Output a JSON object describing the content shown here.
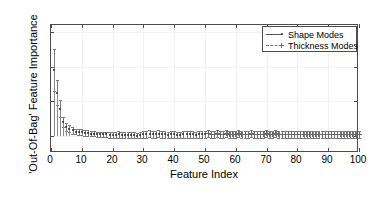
{
  "chart_data": {
    "type": "scatter",
    "title": "",
    "xlabel": "Feature Index",
    "ylabel": "'Out-Of-Bag' Feature Importance",
    "xlim": [
      0,
      100
    ],
    "ylim": [
      -0.25,
      1.6
    ],
    "xticks": [
      0,
      10,
      20,
      30,
      40,
      50,
      60,
      70,
      80,
      90,
      100
    ],
    "xticklabels": [
      "0",
      "10",
      "20",
      "30",
      "40",
      "50",
      "60",
      "70",
      "80",
      "90",
      "100"
    ],
    "yticks": [
      0,
      0.5,
      1,
      1.5
    ],
    "yticklabels": [
      "0",
      "0.5",
      "1",
      "1.5"
    ],
    "grid": true,
    "legend_position": "top-right",
    "marker_color": "#2b2b2b",
    "errorbar_color": "#7a7a7a",
    "series": [
      {
        "name": "Shape Modes",
        "marker": "dot",
        "linestyle": "solid",
        "x": [
          1,
          2,
          3,
          4,
          5,
          6,
          7,
          8,
          9,
          10,
          11,
          12,
          13,
          14,
          15,
          16,
          17,
          18,
          19,
          20,
          21,
          22,
          23,
          24,
          25,
          26,
          27,
          28,
          29,
          30,
          31,
          32,
          33,
          34,
          35,
          36,
          37,
          38,
          39,
          40,
          41,
          42,
          43,
          44,
          45,
          46,
          47,
          48,
          49,
          50
        ],
        "values": [
          0.95,
          0.62,
          0.39,
          0.2,
          0.13,
          0.1,
          0.08,
          0.06,
          0.05,
          0.05,
          0.04,
          0.04,
          0.03,
          0.03,
          0.02,
          0.02,
          0.02,
          0.02,
          0.01,
          0.01,
          0.01,
          0.02,
          0.01,
          0.01,
          0.01,
          0.01,
          0.01,
          0.0,
          0.01,
          0.02,
          0.02,
          0.03,
          0.02,
          0.02,
          0.03,
          0.02,
          0.02,
          0.01,
          0.02,
          0.02,
          0.01,
          0.01,
          0.02,
          0.02,
          0.02,
          0.02,
          0.01,
          0.02,
          0.02,
          0.02
        ],
        "errors": [
          0.3,
          0.18,
          0.12,
          0.07,
          0.06,
          0.05,
          0.05,
          0.04,
          0.04,
          0.04,
          0.04,
          0.04,
          0.04,
          0.04,
          0.04,
          0.04,
          0.04,
          0.04,
          0.04,
          0.04,
          0.04,
          0.05,
          0.04,
          0.04,
          0.04,
          0.04,
          0.04,
          0.04,
          0.04,
          0.05,
          0.05,
          0.05,
          0.05,
          0.05,
          0.05,
          0.05,
          0.05,
          0.04,
          0.05,
          0.05,
          0.04,
          0.04,
          0.05,
          0.05,
          0.05,
          0.05,
          0.04,
          0.05,
          0.05,
          0.05
        ]
      },
      {
        "name": "Thickness Modes",
        "marker": "cross",
        "linestyle": "dashed",
        "x": [
          51,
          52,
          53,
          54,
          55,
          56,
          57,
          58,
          59,
          60,
          61,
          62,
          63,
          64,
          65,
          66,
          67,
          68,
          69,
          70,
          71,
          72,
          73,
          74,
          75,
          76,
          77,
          78,
          79,
          80,
          81,
          82,
          83,
          84,
          85,
          86,
          87,
          88,
          89,
          90,
          91,
          92,
          93,
          94,
          95,
          96,
          97,
          98,
          99,
          100
        ],
        "values": [
          0.03,
          0.02,
          0.02,
          0.03,
          0.02,
          0.02,
          0.03,
          0.02,
          0.02,
          0.02,
          0.03,
          0.02,
          0.02,
          0.02,
          0.03,
          0.02,
          0.02,
          0.02,
          0.02,
          0.03,
          0.02,
          0.02,
          0.03,
          0.02,
          0.02,
          0.02,
          0.02,
          0.02,
          0.02,
          0.02,
          0.02,
          0.02,
          0.02,
          0.02,
          0.02,
          0.02,
          0.02,
          0.02,
          0.02,
          0.02,
          0.02,
          0.02,
          0.02,
          0.02,
          0.02,
          0.02,
          0.02,
          0.02,
          0.02,
          0.02
        ],
        "errors": [
          0.05,
          0.05,
          0.05,
          0.05,
          0.05,
          0.05,
          0.05,
          0.05,
          0.05,
          0.05,
          0.05,
          0.05,
          0.05,
          0.05,
          0.05,
          0.05,
          0.05,
          0.05,
          0.05,
          0.05,
          0.05,
          0.05,
          0.05,
          0.05,
          0.05,
          0.05,
          0.05,
          0.05,
          0.05,
          0.05,
          0.05,
          0.05,
          0.05,
          0.05,
          0.05,
          0.05,
          0.05,
          0.05,
          0.05,
          0.05,
          0.05,
          0.05,
          0.05,
          0.05,
          0.05,
          0.05,
          0.05,
          0.05,
          0.05,
          0.05
        ]
      }
    ]
  },
  "legend": {
    "items": [
      {
        "label": "Shape Modes"
      },
      {
        "label": "Thickness Modes"
      }
    ]
  },
  "axes": {
    "x_title": "Feature Index",
    "y_title": "'Out-Of-Bag' Feature Importance"
  }
}
